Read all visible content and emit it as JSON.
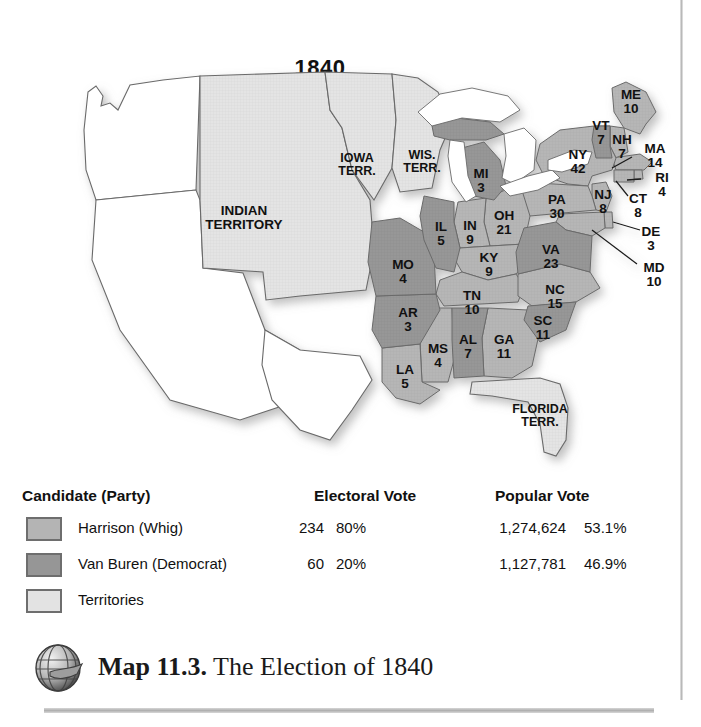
{
  "figure": {
    "year_title": "1840",
    "caption_label": "Map 11.3.",
    "caption_title": "The Election of 1840",
    "globe_icon": "globe-icon"
  },
  "legend": {
    "headers": {
      "candidate": "Candidate (Party)",
      "electoral": "Electoral Vote",
      "popular": "Popular Vote"
    },
    "rows": [
      {
        "swatch": "harrison-swatch",
        "color": "#b4b4b4",
        "name": "Harrison (Whig)",
        "electoral_votes": "234",
        "electoral_pct": "80%",
        "popular_votes": "1,274,624",
        "popular_pct": "53.1%"
      },
      {
        "swatch": "vanburen-swatch",
        "color": "#969696",
        "name": "Van Buren (Democrat)",
        "electoral_votes": "60",
        "electoral_pct": "20%",
        "popular_votes": "1,127,781",
        "popular_pct": "46.9%"
      },
      {
        "swatch": "territories-swatch",
        "color": "#e3e3e3",
        "name": "Territories",
        "electoral_votes": "",
        "electoral_pct": "",
        "popular_votes": "",
        "popular_pct": ""
      }
    ]
  },
  "map": {
    "colors": {
      "harrison": "#b4b4b4",
      "vanburen": "#969696",
      "territory": "#e3e3e3",
      "unorganized": "#ffffff",
      "outline": "#595959",
      "water": "#ffffff"
    },
    "states": [
      {
        "abbr": "ME",
        "votes": "10",
        "winner": "harrison",
        "x": 629,
        "y": 95
      },
      {
        "abbr": "VT",
        "votes": "7",
        "winner": "vanburen",
        "x": 601,
        "y": 126
      },
      {
        "abbr": "NH",
        "votes": "7",
        "winner": "harrison",
        "x": 621,
        "y": 140
      },
      {
        "abbr": "MA",
        "votes": "14",
        "winner": "harrison",
        "x": 655,
        "y": 149
      },
      {
        "abbr": "RI",
        "votes": "4",
        "winner": "harrison",
        "x": 662,
        "y": 178
      },
      {
        "abbr": "CT",
        "votes": "8",
        "winner": "harrison",
        "x": 637,
        "y": 199
      },
      {
        "abbr": "NY",
        "votes": "42",
        "winner": "harrison",
        "x": 578,
        "y": 155
      },
      {
        "abbr": "NJ",
        "votes": "8",
        "winner": "harrison",
        "x": 603,
        "y": 195
      },
      {
        "abbr": "PA",
        "votes": "30",
        "winner": "harrison",
        "x": 557,
        "y": 200
      },
      {
        "abbr": "DE",
        "votes": "3",
        "winner": "harrison",
        "x": 651,
        "y": 232
      },
      {
        "abbr": "MD",
        "votes": "10",
        "winner": "harrison",
        "x": 654,
        "y": 268
      },
      {
        "abbr": "VA",
        "votes": "23",
        "winner": "vanburen",
        "x": 551,
        "y": 250
      },
      {
        "abbr": "NC",
        "votes": "15",
        "winner": "harrison",
        "x": 555,
        "y": 290
      },
      {
        "abbr": "SC",
        "votes": "11",
        "winner": "vanburen",
        "x": 543,
        "y": 321
      },
      {
        "abbr": "GA",
        "votes": "11",
        "winner": "harrison",
        "x": 504,
        "y": 340
      },
      {
        "abbr": "AL",
        "votes": "7",
        "winner": "vanburen",
        "x": 468,
        "y": 340
      },
      {
        "abbr": "MS",
        "votes": "4",
        "winner": "harrison",
        "x": 437,
        "y": 349
      },
      {
        "abbr": "LA",
        "votes": "5",
        "winner": "harrison",
        "x": 404,
        "y": 370
      },
      {
        "abbr": "AR",
        "votes": "3",
        "winner": "vanburen",
        "x": 408,
        "y": 313
      },
      {
        "abbr": "TN",
        "votes": "10",
        "winner": "harrison",
        "x": 471,
        "y": 296
      },
      {
        "abbr": "KY",
        "votes": "9",
        "winner": "harrison",
        "x": 489,
        "y": 258
      },
      {
        "abbr": "MO",
        "votes": "4",
        "winner": "vanburen",
        "x": 403,
        "y": 265
      },
      {
        "abbr": "IL",
        "votes": "5",
        "winner": "vanburen",
        "x": 440,
        "y": 227
      },
      {
        "abbr": "IN",
        "votes": "9",
        "winner": "harrison",
        "x": 470,
        "y": 226
      },
      {
        "abbr": "OH",
        "votes": "21",
        "winner": "harrison",
        "x": 504,
        "y": 216
      },
      {
        "abbr": "MI",
        "votes": "3",
        "winner": "vanburen",
        "x": 481,
        "y": 174
      }
    ],
    "territories": [
      {
        "name": "IOWA\nTERR.",
        "x": 355,
        "y": 159
      },
      {
        "name": "WIS.\nTERR.",
        "x": 421,
        "y": 156
      },
      {
        "name": "INDIAN\nTERRITORY",
        "x": 244,
        "y": 211
      },
      {
        "name": "FLORIDA\nTERR.",
        "x": 539,
        "y": 410
      }
    ]
  }
}
